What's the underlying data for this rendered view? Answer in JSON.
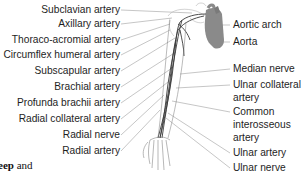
{
  "diagram": {
    "left_labels": [
      {
        "text": "Subclavian artery",
        "y": 4
      },
      {
        "text": "Axillary artery",
        "y": 18
      },
      {
        "text": "Thoraco-acromial artery",
        "y": 34
      },
      {
        "text": "Circumflex humeral artery",
        "y": 49
      },
      {
        "text": "Subscapular artery",
        "y": 65
      },
      {
        "text": "Brachial artery",
        "y": 81
      },
      {
        "text": "Profunda brachii artery",
        "y": 97
      },
      {
        "text": "Radial collateral artery",
        "y": 113
      },
      {
        "text": "Radial nerve",
        "y": 129
      },
      {
        "text": "Radial artery",
        "y": 145
      }
    ],
    "right_labels": [
      {
        "text": "Aortic arch",
        "y": 19
      },
      {
        "text": "Aorta",
        "y": 36
      },
      {
        "text": "Median nerve",
        "y": 63
      },
      {
        "text": "Ulnar collateral",
        "y": 79
      },
      {
        "text": "artery",
        "y": 92
      },
      {
        "text": "Common",
        "y": 106
      },
      {
        "text": "interosseous",
        "y": 119
      },
      {
        "text": "artery",
        "y": 132
      },
      {
        "text": "Ulnar artery",
        "y": 147
      },
      {
        "text": "Ulnar nerve",
        "y": 162
      }
    ],
    "colors": {
      "heart": "#8a8a8a",
      "leader_lines": "#9a9a9a",
      "vessels": "#3a3a3a",
      "text": "#1e1e1e"
    }
  },
  "caption_fragment": {
    "bold": "eep",
    "rest": " and"
  }
}
